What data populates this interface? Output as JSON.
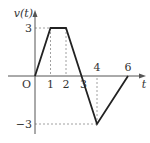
{
  "chart_data": {
    "type": "line",
    "title": "",
    "xlabel": "t",
    "ylabel": "v(t)",
    "origin_label": "O",
    "x": [
      0,
      1,
      2,
      3,
      4,
      6
    ],
    "y": [
      0,
      3,
      3,
      0,
      -3,
      0
    ],
    "xlim": [
      0,
      7
    ],
    "ylim": [
      -3.8,
      4.5
    ],
    "x_tick_labels": [
      "1",
      "2",
      "3",
      "4",
      "6"
    ],
    "x_tick_values": [
      1,
      2,
      3,
      4,
      6
    ],
    "y_tick_labels": [
      "3",
      "-3"
    ],
    "y_tick_values": [
      3,
      -3
    ],
    "guides": [
      {
        "from": [
          0,
          3
        ],
        "to": [
          2,
          3
        ],
        "type": "horizontal-dashed"
      },
      {
        "from": [
          1,
          3
        ],
        "to": [
          1,
          0
        ],
        "type": "vertical-dashed"
      },
      {
        "from": [
          2,
          3
        ],
        "to": [
          2,
          0
        ],
        "type": "vertical-dashed"
      },
      {
        "from": [
          0,
          -3
        ],
        "to": [
          4,
          -3
        ],
        "type": "horizontal-dashed"
      },
      {
        "from": [
          4,
          -3
        ],
        "to": [
          4,
          0
        ],
        "type": "vertical-dashed"
      }
    ],
    "grid": false,
    "colors": {
      "line": "#222222",
      "axis": "#555555",
      "guide": "#888888"
    }
  }
}
